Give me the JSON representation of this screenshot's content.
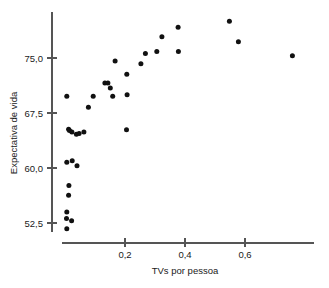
{
  "chart_data": {
    "type": "scatter",
    "title": "",
    "subtitle": "",
    "xlabel": "TVs por pessoa",
    "ylabel": "Expectativa de vida",
    "xlim": [
      0.0,
      0.79
    ],
    "ylim": [
      50.5,
      81.5
    ],
    "xticks": [
      0.2,
      0.4,
      0.6
    ],
    "xticklabels": [
      "0,2",
      "0,4",
      "0,6"
    ],
    "yticks": [
      52.5,
      60.0,
      67.5,
      75.0
    ],
    "yticklabels": [
      "52,5",
      "60,0",
      "67,5",
      "75,0"
    ],
    "grid": false,
    "legend": null,
    "marker": "filled-circle",
    "marker_color": "#111111",
    "axis_color": "#555555",
    "points": [
      {
        "x": 0.006,
        "y": 51.7
      },
      {
        "x": 0.005,
        "y": 53.1
      },
      {
        "x": 0.006,
        "y": 54.0
      },
      {
        "x": 0.022,
        "y": 52.8
      },
      {
        "x": 0.012,
        "y": 56.3
      },
      {
        "x": 0.013,
        "y": 57.6
      },
      {
        "x": 0.006,
        "y": 60.8
      },
      {
        "x": 0.024,
        "y": 61.0
      },
      {
        "x": 0.04,
        "y": 60.3
      },
      {
        "x": 0.012,
        "y": 65.3
      },
      {
        "x": 0.015,
        "y": 65.1
      },
      {
        "x": 0.023,
        "y": 64.9
      },
      {
        "x": 0.038,
        "y": 64.6
      },
      {
        "x": 0.047,
        "y": 64.7
      },
      {
        "x": 0.063,
        "y": 64.9
      },
      {
        "x": 0.006,
        "y": 69.8
      },
      {
        "x": 0.078,
        "y": 68.3
      },
      {
        "x": 0.094,
        "y": 69.8
      },
      {
        "x": 0.133,
        "y": 71.6
      },
      {
        "x": 0.143,
        "y": 71.6
      },
      {
        "x": 0.151,
        "y": 70.9
      },
      {
        "x": 0.159,
        "y": 69.8
      },
      {
        "x": 0.167,
        "y": 74.6
      },
      {
        "x": 0.206,
        "y": 72.8
      },
      {
        "x": 0.207,
        "y": 70.0
      },
      {
        "x": 0.205,
        "y": 65.2
      },
      {
        "x": 0.253,
        "y": 74.2
      },
      {
        "x": 0.268,
        "y": 75.6
      },
      {
        "x": 0.306,
        "y": 75.9
      },
      {
        "x": 0.323,
        "y": 77.9
      },
      {
        "x": 0.377,
        "y": 79.2
      },
      {
        "x": 0.378,
        "y": 75.9
      },
      {
        "x": 0.548,
        "y": 80.0
      },
      {
        "x": 0.578,
        "y": 77.2
      },
      {
        "x": 0.758,
        "y": 75.3
      }
    ]
  }
}
